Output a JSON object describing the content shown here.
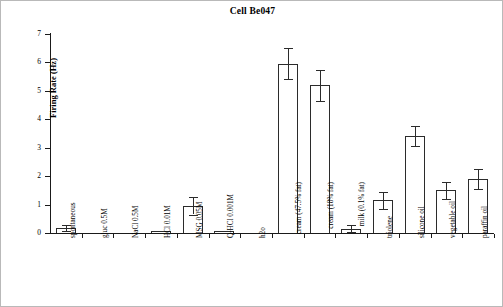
{
  "chart_data": {
    "type": "bar",
    "title": "Cell Be047",
    "xlabel": "",
    "ylabel": "Firing Rate (Hz)",
    "ylim": [
      0,
      7
    ],
    "yticks": [
      0,
      1,
      2,
      3,
      4,
      5,
      6,
      7
    ],
    "ytick_labels": [
      "0",
      "1",
      "2",
      "3",
      "4",
      "5",
      "6",
      "7"
    ],
    "grid": false,
    "legend": "none",
    "error_bars": "SEM",
    "categories": [
      "spontaneous",
      "gluc 0.5M",
      "NaCl 0.5M",
      "HCl 0.01M",
      "MSG 0.05M",
      "Q-HCl 0.001M",
      "h2o",
      "cream (47.5% fat)",
      "cream (18% fat)",
      "milk (0.1% fat)",
      "triolene",
      "silicone oil",
      "vegetable oil",
      "paraffin oil"
    ],
    "values": [
      0.17,
      0.0,
      0.0,
      0.05,
      0.95,
      0.05,
      0.0,
      5.95,
      5.2,
      0.15,
      1.15,
      3.4,
      1.5,
      1.9
    ],
    "errors": [
      0.1,
      0.0,
      0.0,
      0.0,
      0.3,
      0.0,
      0.0,
      0.55,
      0.55,
      0.12,
      0.3,
      0.35,
      0.3,
      0.35
    ]
  },
  "chart": {
    "title": "Cell Be047",
    "ylabel": "Firing Rate (Hz)"
  }
}
